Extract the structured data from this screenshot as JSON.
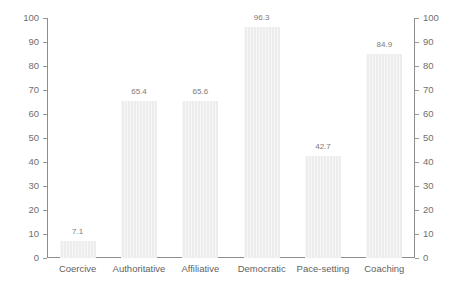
{
  "chart_data": {
    "type": "bar",
    "title": "",
    "subtitle": "",
    "xlabel": "",
    "ylabel": "",
    "categories": [
      "Coercive",
      "Authoritative",
      "Affiliative",
      "Democratic",
      "Pace-setting",
      "Coaching"
    ],
    "values": [
      7.1,
      65.4,
      65.6,
      96.3,
      42.7,
      84.9
    ],
    "value_labels": [
      "7.1",
      "65.4",
      "65.6",
      "96.3",
      "42.7",
      "84.9"
    ],
    "ylim": [
      0,
      100
    ],
    "y_tick_step": 10,
    "y_ticks": [
      0,
      10,
      20,
      30,
      40,
      50,
      60,
      70,
      80,
      90,
      100
    ],
    "y_tick_labels": [
      "0",
      "10",
      "20",
      "30",
      "40",
      "50",
      "60",
      "70",
      "80",
      "90",
      "100"
    ],
    "dual_axis": true,
    "left_axis_labels": [
      "0",
      "10",
      "20",
      "30",
      "40",
      "50",
      "60",
      "70",
      "80",
      "90",
      "100"
    ],
    "right_axis_labels": [
      "0",
      "10",
      "20",
      "30",
      "40",
      "50",
      "60",
      "70",
      "80",
      "90",
      "100"
    ],
    "grid": false,
    "legend": null,
    "legend_position": "none",
    "show_data_labels": true,
    "colors": {
      "bar_fill": "#ededed",
      "axis_line": "#8d8d8d",
      "tick_mark": "#9b9b9b",
      "tick_label_text": "#6f6f6f",
      "category_label_text": "#5f5f5f",
      "data_label_text": "#7b7b7b",
      "background": "#ffffff"
    }
  }
}
